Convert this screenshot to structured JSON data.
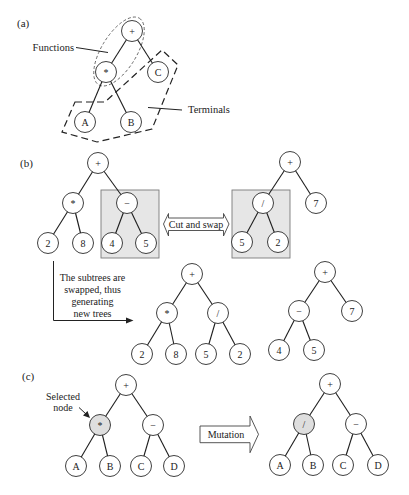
{
  "figure": {
    "panel_a": {
      "label": "(a)",
      "functions_label": "Functions",
      "terminals_label": "Terminals",
      "tree_nodes": [
        "+",
        "*",
        "C",
        "A",
        "B"
      ]
    },
    "panel_b": {
      "label": "(b)",
      "cut_and_swap_label": "Cut and swap",
      "caption_lines": [
        "The subtrees are",
        "swapped, thus",
        "generating",
        "new trees"
      ],
      "parent1_nodes": [
        "+",
        "*",
        "−",
        "2",
        "8",
        "4",
        "5"
      ],
      "parent2_nodes": [
        "+",
        "/",
        "7",
        "5",
        "2"
      ],
      "offspring1_nodes": [
        "+",
        "*",
        "/",
        "2",
        "8",
        "5",
        "2"
      ],
      "offspring2_nodes": [
        "+",
        "−",
        "7",
        "4",
        "5"
      ]
    },
    "panel_c": {
      "label": "(c)",
      "selected_node_label": [
        "Selected",
        "node"
      ],
      "mutation_label": "Mutation",
      "original_nodes": [
        "+",
        "*",
        "−",
        "A",
        "B",
        "C",
        "D"
      ],
      "mutated_nodes": [
        "+",
        "/",
        "−",
        "A",
        "B",
        "C",
        "D"
      ]
    }
  },
  "colors": {
    "line": "#1e1e1e",
    "subtree_box_fill": "#e6e6e6",
    "selected_node_fill": "#dedede",
    "background": "#ffffff"
  }
}
